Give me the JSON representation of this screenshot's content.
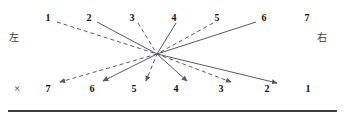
{
  "diagram": {
    "center": {
      "x": 157,
      "y": 54
    },
    "stroke_color": "#5a5a66",
    "text_color": "#111111",
    "side_labels": [
      {
        "name": "left",
        "text": "左",
        "x": 14,
        "y": 38
      },
      {
        "name": "right",
        "text": "右",
        "x": 322,
        "y": 38
      }
    ],
    "row_marks": [
      {
        "name": "cross-mark",
        "text": "×",
        "x": 17,
        "y": 88
      }
    ],
    "top_row": {
      "y": 18,
      "labels": [
        {
          "text": "1",
          "x": 48
        },
        {
          "text": "2",
          "x": 89
        },
        {
          "text": "3",
          "x": 132
        },
        {
          "text": "4",
          "x": 174
        },
        {
          "text": "5",
          "x": 217
        },
        {
          "text": "6",
          "x": 264
        },
        {
          "text": "7",
          "x": 307
        }
      ]
    },
    "bottom_row": {
      "y": 89,
      "labels": [
        {
          "text": "7",
          "x": 48
        },
        {
          "text": "6",
          "x": 92
        },
        {
          "text": "5",
          "x": 134
        },
        {
          "text": "4",
          "x": 176
        },
        {
          "text": "3",
          "x": 221
        },
        {
          "text": "2",
          "x": 267
        },
        {
          "text": "1",
          "x": 308
        }
      ]
    },
    "connections": [
      {
        "from": "1",
        "to": "7",
        "style": "dashed",
        "x1": 57,
        "y1": 22,
        "x2": 60,
        "y2": 82
      },
      {
        "from": "2",
        "to": "6",
        "style": "solid",
        "x1": 97,
        "y1": 22,
        "x2": 103,
        "y2": 81
      },
      {
        "from": "3",
        "to": "5",
        "style": "dashed",
        "x1": 138,
        "y1": 23,
        "x2": 146,
        "y2": 81
      },
      {
        "from": "4",
        "to": "4",
        "style": "solid",
        "x1": 176,
        "y1": 23,
        "x2": 187,
        "y2": 81
      },
      {
        "from": "5",
        "to": "3",
        "style": "dashed",
        "x1": 213,
        "y1": 23,
        "x2": 231,
        "y2": 82
      },
      {
        "from": "6",
        "to": "2",
        "style": "solid",
        "x1": 256,
        "y1": 22,
        "x2": 277,
        "y2": 83
      }
    ],
    "baseline": {
      "y": 110
    }
  }
}
